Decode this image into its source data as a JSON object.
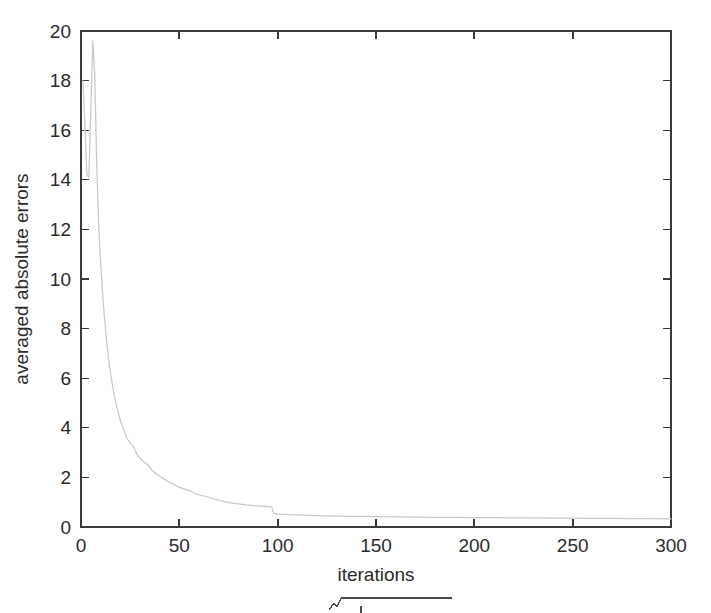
{
  "figure": {
    "background_color": "#ffffff",
    "axis_color": "#3a3a3a",
    "curve_color": "#c9c9c9",
    "text_color": "#2b2b2b"
  },
  "chart_data": {
    "type": "line",
    "title": "",
    "subtitle": "",
    "xlabel": "iterations",
    "ylabel": "averaged absolute errors",
    "xlim": [
      0,
      300
    ],
    "ylim": [
      0,
      20
    ],
    "xticks": [
      0,
      50,
      100,
      150,
      200,
      250,
      300
    ],
    "xticklabels": [
      "0",
      "50",
      "100",
      "150",
      "200",
      "250",
      "300"
    ],
    "yticks": [
      0,
      2,
      4,
      6,
      8,
      10,
      12,
      14,
      16,
      18,
      20
    ],
    "yticklabels": [
      "0",
      "2",
      "4",
      "6",
      "8",
      "10",
      "12",
      "14",
      "16",
      "18",
      "20"
    ],
    "grid": false,
    "legend": null,
    "legend_position": "none",
    "tick_direction": "in",
    "box_frame": true,
    "series": [
      {
        "name": "averaged absolute errors",
        "color": "#c9c9c9",
        "linewidth": 1.25,
        "x": [
          1,
          2,
          3,
          4,
          5,
          6,
          7,
          8,
          9,
          10,
          11,
          12,
          13,
          14,
          15,
          16,
          17,
          18,
          19,
          20,
          21,
          22,
          23,
          24,
          25,
          26,
          27,
          28,
          29,
          30,
          32,
          34,
          36,
          38,
          40,
          42,
          44,
          46,
          48,
          50,
          53,
          56,
          59,
          62,
          65,
          68,
          71,
          74,
          77,
          80,
          84,
          88,
          92,
          95,
          96,
          97,
          98,
          100,
          105,
          110,
          120,
          130,
          140,
          150,
          160,
          170,
          180,
          190,
          200,
          210,
          220,
          230,
          240,
          250,
          260,
          270,
          280,
          290,
          300
        ],
        "y": [
          18.0,
          16.2,
          14.2,
          14.1,
          16.8,
          19.6,
          18.2,
          14.6,
          12.2,
          10.6,
          9.4,
          8.4,
          7.5,
          6.8,
          6.2,
          5.7,
          5.3,
          4.9,
          4.6,
          4.3,
          4.05,
          3.85,
          3.65,
          3.5,
          3.38,
          3.3,
          3.22,
          3.0,
          2.85,
          2.78,
          2.62,
          2.5,
          2.3,
          2.16,
          2.05,
          1.95,
          1.85,
          1.76,
          1.68,
          1.6,
          1.52,
          1.45,
          1.32,
          1.26,
          1.2,
          1.13,
          1.06,
          1.0,
          0.96,
          0.93,
          0.89,
          0.86,
          0.84,
          0.82,
          0.81,
          0.8,
          0.55,
          0.52,
          0.5,
          0.49,
          0.46,
          0.44,
          0.43,
          0.42,
          0.41,
          0.4,
          0.39,
          0.385,
          0.38,
          0.375,
          0.37,
          0.365,
          0.36,
          0.355,
          0.35,
          0.345,
          0.34,
          0.335,
          0.33
        ]
      }
    ],
    "annotations": [
      {
        "name": "initial-spike",
        "text": "",
        "x": 6,
        "y": 19.6
      },
      {
        "name": "step-drop",
        "text": "",
        "x": 97,
        "y": 0.55
      }
    ]
  },
  "caption": {
    "partial_formula_visible": true,
    "description": "radical-sign-top-edge"
  }
}
